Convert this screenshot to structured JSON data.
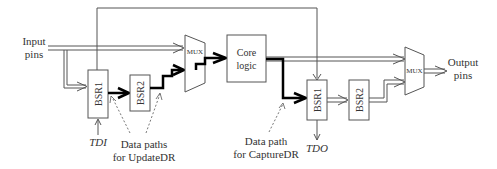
{
  "diagram": {
    "type": "boundary-scan-data-paths",
    "labels": {
      "input_pins_line1": "Input",
      "input_pins_line2": "pins",
      "output_pins_line1": "Output",
      "output_pins_line2": "pins",
      "tdi": "TDI",
      "tdo": "TDO",
      "update_note_line1": "Data paths",
      "update_note_line2": "for UpdateDR",
      "capture_note_line1": "Data path",
      "capture_note_line2": "for CaptureDR"
    },
    "blocks": {
      "bsr1_in": "BSR1",
      "bsr2_in": "BSR2",
      "mux_in": "MUX",
      "core_line1": "Core",
      "core_line2": "logic",
      "bsr1_out": "BSR1",
      "bsr2_out": "BSR2",
      "mux_out": "MUX"
    },
    "colors": {
      "stroke": "#555555",
      "thick_path": "#000000",
      "text": "#333333"
    }
  }
}
